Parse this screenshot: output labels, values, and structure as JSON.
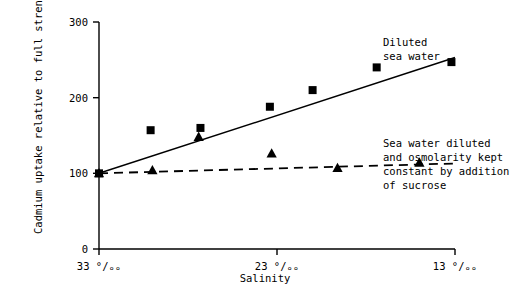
{
  "chart_data": {
    "type": "scatter",
    "title": "",
    "xlabel": "Salinity",
    "ylabel": "Cadmium uptake relative to full strength sea water (=100)",
    "xlim": [
      33,
      13
    ],
    "ylim": [
      0,
      300
    ],
    "x_ticks": [
      {
        "value": 33,
        "label": "33 °/ₒₒ"
      },
      {
        "value": 23,
        "label": "23 °/ₒₒ"
      },
      {
        "value": 13,
        "label": "13 °/ₒₒ"
      }
    ],
    "y_ticks": [
      {
        "value": 0,
        "label": "0"
      },
      {
        "value": 100,
        "label": "100"
      },
      {
        "value": 200,
        "label": "200"
      },
      {
        "value": 300,
        "label": "300"
      }
    ],
    "grid": false,
    "legend_position": "inline-annotations",
    "series": [
      {
        "name": "Diluted sea water",
        "marker": "square",
        "line_style": "solid",
        "color": "#000000",
        "points": [
          {
            "x": 33.0,
            "y": 100
          },
          {
            "x": 30.1,
            "y": 157
          },
          {
            "x": 27.3,
            "y": 160
          },
          {
            "x": 23.4,
            "y": 188
          },
          {
            "x": 21.0,
            "y": 210
          },
          {
            "x": 17.4,
            "y": 240
          },
          {
            "x": 13.2,
            "y": 247
          }
        ],
        "fit_line": [
          {
            "x": 33.0,
            "y": 100
          },
          {
            "x": 13.0,
            "y": 253
          }
        ],
        "annotation": {
          "lines": [
            "Diluted",
            "sea water"
          ],
          "x": 23.2,
          "y": 268
        }
      },
      {
        "name": "Sea water diluted and osmolarity kept constant by addition of sucrose",
        "marker": "triangle",
        "line_style": "dashed",
        "color": "#000000",
        "points": [
          {
            "x": 33.0,
            "y": 100
          },
          {
            "x": 30.0,
            "y": 104
          },
          {
            "x": 27.4,
            "y": 148
          },
          {
            "x": 23.3,
            "y": 126
          },
          {
            "x": 19.6,
            "y": 107
          },
          {
            "x": 15.0,
            "y": 114
          }
        ],
        "fit_line": [
          {
            "x": 33.0,
            "y": 100
          },
          {
            "x": 13.0,
            "y": 113
          }
        ],
        "annotation": {
          "lines": [
            "Sea water diluted",
            "and osmolarity kept",
            "constant by addition",
            "of sucrose"
          ],
          "x": 23.2,
          "y": 175
        }
      }
    ],
    "annotations": {
      "diluted_sea_water": [
        "Diluted",
        "sea water"
      ],
      "sucrose": [
        "Sea water diluted",
        "and osmolarity kept",
        "constant by addition",
        "of sucrose"
      ]
    },
    "axis_color": "#000000"
  }
}
